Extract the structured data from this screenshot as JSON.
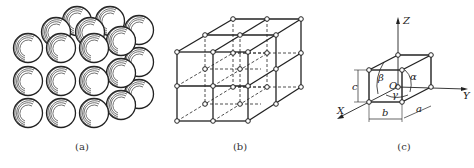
{
  "figure": {
    "panels": [
      {
        "id": "a",
        "caption": "(a)",
        "description": "Hard-sphere packing model of a crystal: 3x3 front layer of atoms with layers stacked behind"
      },
      {
        "id": "b",
        "caption": "(b)",
        "description": "Crystal lattice: 2x2x2 array of unit cells with lattice points as small circles; hidden edges dashed"
      },
      {
        "id": "c",
        "caption": "(c)",
        "description": "Unit cell with axes and lattice parameters"
      }
    ],
    "unit_cell": {
      "axes": {
        "x": "X",
        "y": "Y",
        "z": "Z"
      },
      "origin": "O",
      "edges": {
        "a": "a",
        "b": "b",
        "c": "c"
      },
      "angles": {
        "alpha": "α",
        "beta": "β",
        "gamma": "γ"
      }
    }
  }
}
